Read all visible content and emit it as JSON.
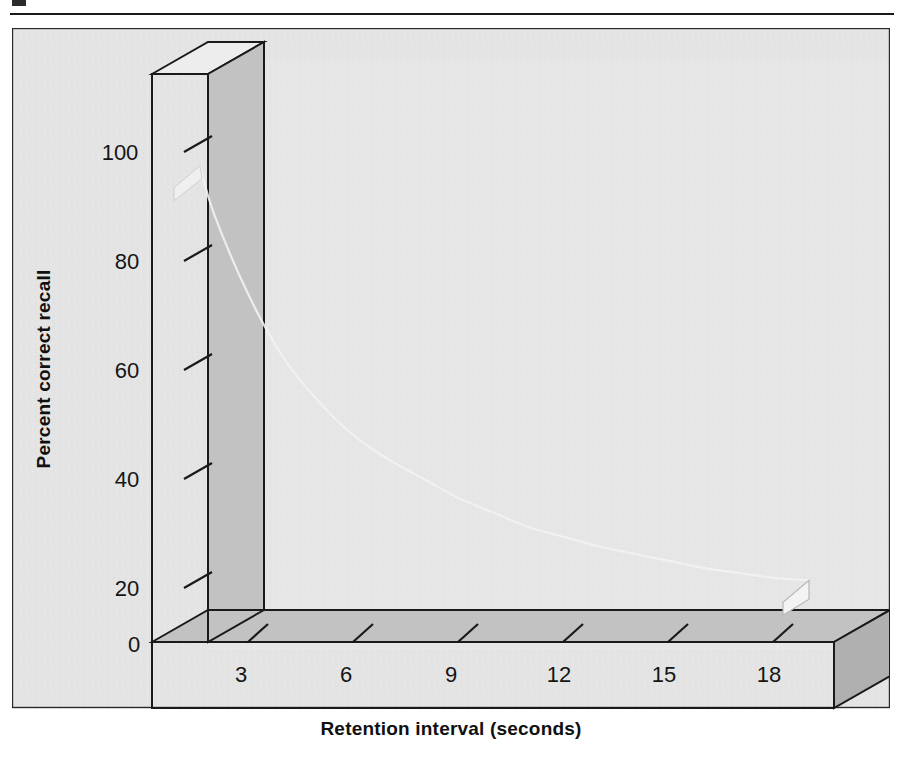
{
  "figure": {
    "background_color": "#ffffff",
    "panel_color": "#e4e4e4",
    "axis_face_color": "#c9c9c9",
    "axis_top_color": "#ededed",
    "axis_side_color": "#b4b4b4",
    "outline_color": "#1a1a1a",
    "curve_color": "#8d8d8d",
    "curve_highlight_color": "#d6d6d6",
    "curve_shadow_color": "#c0c0c0"
  },
  "chart_data": {
    "type": "line",
    "title": "",
    "subtitle": "",
    "xlabel": "Retention interval (seconds)",
    "ylabel": "Percent correct recall",
    "xlim": [
      0,
      19.5
    ],
    "ylim": [
      0,
      108
    ],
    "xticks": [
      3,
      6,
      9,
      12,
      15,
      18
    ],
    "xtick_labels": [
      "3",
      "6",
      "9",
      "12",
      "15",
      "18"
    ],
    "yticks": [
      0,
      20,
      40,
      60,
      80,
      100
    ],
    "ytick_labels": [
      "0",
      "20",
      "40",
      "60",
      "80",
      "100"
    ],
    "origin_label": "0",
    "grid": false,
    "legend": false,
    "legend_position": "none",
    "style": "3d-ribbon",
    "series": [
      {
        "name": "Percent correct recall",
        "x": [
          0.6,
          1,
          2,
          3,
          4,
          5,
          6,
          7,
          8,
          9,
          10,
          11,
          12,
          13,
          14,
          15,
          16,
          17,
          18
        ],
        "y": [
          90,
          80,
          63,
          50,
          41,
          34,
          29,
          25,
          21,
          18,
          15,
          13,
          11,
          9.5,
          8,
          6.5,
          5.5,
          4.5,
          4
        ]
      }
    ],
    "annotations": []
  }
}
